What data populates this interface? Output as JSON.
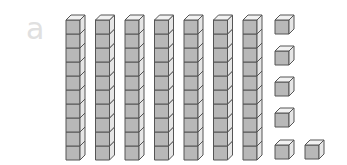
{
  "figure": {
    "label": "a",
    "tens_rods": 7,
    "units_per_rod": 10,
    "unit_cubes": 6,
    "colors": {
      "front": "#b8b8b8",
      "top": "#f2f2f2",
      "side": "#e6e6e6",
      "stroke": "#555555"
    }
  }
}
